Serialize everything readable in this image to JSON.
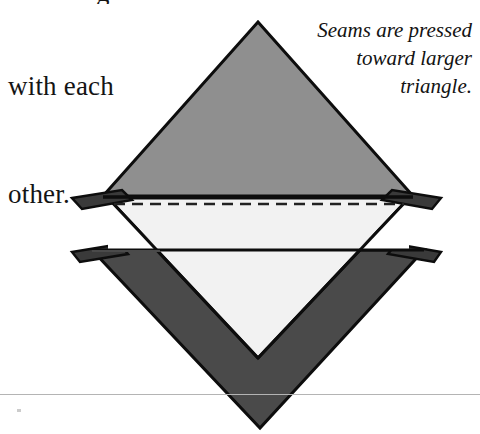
{
  "page": {
    "width": 480,
    "height": 434,
    "background": "#ffffff"
  },
  "instruction_text": {
    "clipped_previous_line": "g",
    "lines": [
      "with each",
      "other."
    ]
  },
  "caption": {
    "lines": [
      "Seams are pressed",
      "toward larger",
      "triangle."
    ],
    "style": "italic"
  },
  "diagram": {
    "name": "pressed-seam-triangle-unit",
    "colors": {
      "top_triangle_fill": "#8f8f8f",
      "center_triangle_fill": "#f2f2f2",
      "bottom_triangle_fill": "#4a4a4a",
      "seam_tab_fill": "#3a3a3a",
      "notch_fill": "#ffffff",
      "outline": "#0d0d0d",
      "dashed_seam_line": "#222222",
      "page_rule": "#b4b4b4"
    },
    "parts": [
      {
        "name": "top-large-triangle",
        "label": "larger triangle (light gray)"
      },
      {
        "name": "center-small-triangle",
        "label": "smaller triangle (white)"
      },
      {
        "name": "bottom-large-triangle",
        "label": "larger triangle (dark gray)"
      },
      {
        "name": "upper-seam-allowance-tab-left",
        "label": "seam allowance"
      },
      {
        "name": "upper-seam-allowance-tab-right",
        "label": "seam allowance"
      },
      {
        "name": "lower-seam-allowance-tab-left",
        "label": "seam allowance"
      },
      {
        "name": "lower-seam-allowance-tab-right",
        "label": "seam allowance"
      },
      {
        "name": "stitching-line-dashed",
        "label": "stitching line"
      }
    ]
  },
  "geometry": {
    "top_apex": [
      258,
      22
    ],
    "top_base_left": [
      103,
      196
    ],
    "top_base_right": [
      413,
      196
    ],
    "center_top_left": [
      108,
      198
    ],
    "center_top_right": [
      409,
      198
    ],
    "center_apex": [
      258,
      358
    ],
    "bottom_top_left": [
      92,
      250
    ],
    "bottom_top_right": [
      424,
      250
    ],
    "bottom_apex": [
      260,
      428
    ],
    "dashed_line_y": 203,
    "dashed_line_x_start": 114,
    "dashed_line_x_end": 404,
    "tab_left_x": 72,
    "tab_right_x": 441,
    "bottom_rule_y": 394
  }
}
